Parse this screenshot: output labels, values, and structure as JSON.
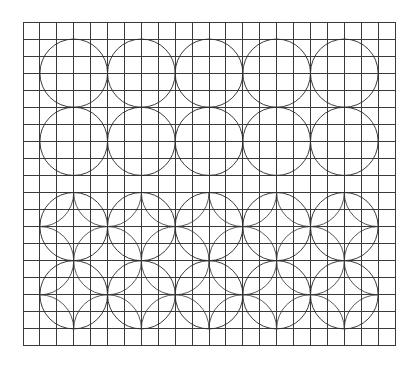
{
  "figure": {
    "width": 419,
    "height": 367,
    "background": "#ffffff",
    "line_color": "#3a3a3a",
    "circle_color": "#2f2f2f"
  },
  "grid": {
    "origin_x": 23,
    "origin_y": 22,
    "columns": 22,
    "rows": 19,
    "cell_width": 16.91,
    "cell_height": 17.05
  },
  "top_pattern": {
    "description": "Tangent circles on square grid",
    "radius_cells": 2,
    "centers": [
      [
        3,
        3
      ],
      [
        7,
        3
      ],
      [
        11,
        3
      ],
      [
        15,
        3
      ],
      [
        19,
        3
      ],
      [
        3,
        7
      ],
      [
        7,
        7
      ],
      [
        11,
        7
      ],
      [
        15,
        7
      ],
      [
        19,
        7
      ]
    ]
  },
  "bottom_pattern": {
    "description": "Tangent circles with overlapping corner-centered circles clipped inside",
    "radius_cells": 2,
    "main_centers": [
      [
        3,
        12
      ],
      [
        7,
        12
      ],
      [
        11,
        12
      ],
      [
        15,
        12
      ],
      [
        19,
        12
      ],
      [
        3,
        16
      ],
      [
        7,
        16
      ],
      [
        11,
        16
      ],
      [
        15,
        16
      ],
      [
        19,
        16
      ]
    ],
    "corner_centers": [
      [
        1,
        10
      ],
      [
        5,
        10
      ],
      [
        9,
        10
      ],
      [
        13,
        10
      ],
      [
        17,
        10
      ],
      [
        21,
        10
      ],
      [
        1,
        14
      ],
      [
        5,
        14
      ],
      [
        9,
        14
      ],
      [
        13,
        14
      ],
      [
        17,
        14
      ],
      [
        21,
        14
      ],
      [
        1,
        18
      ],
      [
        5,
        18
      ],
      [
        9,
        18
      ],
      [
        13,
        18
      ],
      [
        17,
        18
      ],
      [
        21,
        18
      ]
    ]
  }
}
